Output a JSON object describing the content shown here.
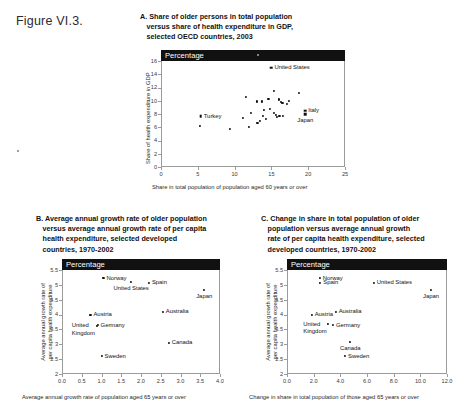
{
  "figure_label": "Figure VI.3.",
  "panels": [
    {
      "id": "A",
      "title_lines": [
        "A. Share of older persons in total population",
        "versus share of health expenditure in GDP,",
        "selected OECD countries, 2003"
      ],
      "header_label": "Percentage"
    },
    {
      "id": "B",
      "title_lines": [
        "B. Average annual growth rate of older population",
        "versus average annual growth rate of per capita",
        "health expenditure, selected developed",
        "countries, 1970-2002"
      ],
      "header_label": "Percentage"
    },
    {
      "id": "C",
      "title_lines": [
        "C. Change in share in total population of older",
        "population versus average annual growth",
        "rate of per capita health expenditure, selected",
        "developed countries, 1970-2002"
      ],
      "header_label": "Percentage"
    }
  ],
  "chart_data": [
    {
      "panel": "A",
      "type": "scatter",
      "title": "A. Share of older persons in total population versus share of health expenditure in GDP, selected OECD countries, 2003",
      "unit_banner": "Percentage",
      "xlabel": "Share in total population of population aged 60 years or over",
      "ylabel": "Share of health expenditure in GDP",
      "xlim": [
        0,
        25
      ],
      "ylim": [
        0,
        16
      ],
      "xticks": [
        0,
        5,
        10,
        15,
        20,
        25
      ],
      "yticks": [
        0,
        2,
        4,
        6,
        8,
        10,
        12,
        14,
        16
      ],
      "xtick_labels": [
        "0",
        "5",
        "10",
        "15",
        "20",
        "25"
      ],
      "ytick_labels": [
        "0",
        "2",
        "4",
        "6",
        "8",
        "10",
        "12",
        "14",
        "16"
      ],
      "grid": false,
      "legend": "none",
      "points": [
        {
          "x": 15.0,
          "y": 15.0,
          "label": "United States",
          "label_pos": "right",
          "marker": "square"
        },
        {
          "x": 5.4,
          "y": 7.7,
          "label": "Turkey",
          "label_pos": "right",
          "marker": "square"
        },
        {
          "x": 19.6,
          "y": 8.5,
          "label": "Italy",
          "label_pos": "right",
          "marker": "square"
        },
        {
          "x": 19.6,
          "y": 8.0,
          "label": "Japan",
          "label_pos": "below",
          "marker": "square"
        },
        {
          "x": 5.3,
          "y": 6.2,
          "label": "",
          "marker": "dot"
        },
        {
          "x": 9.4,
          "y": 5.7,
          "label": "",
          "marker": "dot"
        },
        {
          "x": 11.1,
          "y": 7.4,
          "label": "",
          "marker": "dot"
        },
        {
          "x": 11.6,
          "y": 10.6,
          "label": "",
          "marker": "dot"
        },
        {
          "x": 11.9,
          "y": 6.0,
          "label": "",
          "marker": "dot"
        },
        {
          "x": 12.2,
          "y": 8.2,
          "label": "",
          "marker": "dot"
        },
        {
          "x": 13.0,
          "y": 9.9,
          "label": "",
          "marker": "dot"
        },
        {
          "x": 13.1,
          "y": 6.7,
          "label": "",
          "marker": "dot"
        },
        {
          "x": 13.4,
          "y": 6.9,
          "label": "",
          "marker": "dot"
        },
        {
          "x": 13.7,
          "y": 9.9,
          "label": "",
          "marker": "dot"
        },
        {
          "x": 13.9,
          "y": 7.7,
          "label": "",
          "marker": "dot"
        },
        {
          "x": 14.0,
          "y": 8.6,
          "label": "",
          "marker": "dot"
        },
        {
          "x": 14.3,
          "y": 7.2,
          "label": "",
          "marker": "dot"
        },
        {
          "x": 14.6,
          "y": 10.3,
          "label": "",
          "marker": "dot"
        },
        {
          "x": 14.8,
          "y": 8.8,
          "label": "",
          "marker": "dot"
        },
        {
          "x": 15.3,
          "y": 11.5,
          "label": "",
          "marker": "dot"
        },
        {
          "x": 15.4,
          "y": 8.2,
          "label": "",
          "marker": "dot"
        },
        {
          "x": 15.6,
          "y": 7.8,
          "label": "",
          "marker": "dot"
        },
        {
          "x": 15.8,
          "y": 7.6,
          "label": "",
          "marker": "dot"
        },
        {
          "x": 16.0,
          "y": 10.2,
          "label": "",
          "marker": "dot"
        },
        {
          "x": 16.1,
          "y": 7.7,
          "label": "",
          "marker": "dot"
        },
        {
          "x": 16.3,
          "y": 9.8,
          "label": "",
          "marker": "dot"
        },
        {
          "x": 16.5,
          "y": 9.7,
          "label": "",
          "marker": "dot"
        },
        {
          "x": 16.6,
          "y": 7.7,
          "label": "",
          "marker": "dot"
        },
        {
          "x": 17.1,
          "y": 9.5,
          "label": "",
          "marker": "dot"
        },
        {
          "x": 17.4,
          "y": 10.0,
          "label": "",
          "marker": "dot"
        },
        {
          "x": 18.8,
          "y": 11.2,
          "label": "",
          "marker": "dot"
        }
      ]
    },
    {
      "panel": "B",
      "type": "scatter",
      "title": "B. Average annual growth rate of older population versus average annual growth rate of per capita health expenditure, selected developed countries, 1970-2002",
      "unit_banner": "Percentage",
      "xlabel": "Average annual growth rate of population aged 65 years or over",
      "ylabel": "Average annual growth rate of per capita health expenditure",
      "xlim": [
        0.0,
        4.0
      ],
      "ylim": [
        2.0,
        5.5
      ],
      "xticks": [
        0.0,
        0.5,
        1.0,
        1.5,
        2.0,
        2.5,
        3.0,
        3.5,
        4.0
      ],
      "yticks": [
        2,
        2.5,
        3,
        3.5,
        4,
        4.5,
        5,
        5.5
      ],
      "xtick_labels": [
        "0.0",
        "0.5",
        "1.0",
        "1.5",
        "2.0",
        "2.5",
        "3.0",
        "3.5",
        "4.0"
      ],
      "ytick_labels": [
        "2",
        "2.5",
        "3",
        "3.5",
        "4",
        "4.5",
        "5",
        "5.5"
      ],
      "grid": false,
      "legend": "none",
      "points": [
        {
          "x": 1.05,
          "y": 5.23,
          "label": "Norway",
          "label_pos": "right"
        },
        {
          "x": 1.75,
          "y": 5.1,
          "label": "United States",
          "label_pos": "below"
        },
        {
          "x": 2.2,
          "y": 5.07,
          "label": "Spain",
          "label_pos": "right"
        },
        {
          "x": 3.6,
          "y": 4.83,
          "label": "Japan",
          "label_pos": "below"
        },
        {
          "x": 2.55,
          "y": 4.1,
          "label": "Australia",
          "label_pos": "right"
        },
        {
          "x": 0.72,
          "y": 4.0,
          "label": "Austria",
          "label_pos": "right"
        },
        {
          "x": 0.9,
          "y": 3.65,
          "label": "Germany",
          "label_pos": "right"
        },
        {
          "x": 0.88,
          "y": 3.62,
          "label": "United Kingdom",
          "label_pos": "left"
        },
        {
          "x": 2.7,
          "y": 3.05,
          "label": "Canada",
          "label_pos": "right"
        },
        {
          "x": 1.0,
          "y": 2.6,
          "label": "Sweden",
          "label_pos": "right"
        }
      ]
    },
    {
      "panel": "C",
      "type": "scatter",
      "title": "C. Change in share in total population of older population versus average annual growth rate of per capita health expenditure, selected developed countries, 1970-2002",
      "unit_banner": "Percentage",
      "xlabel": "Change in share in total population of those aged 65 years or over",
      "ylabel": "Average annual growth rate of per capita health expenditure",
      "xlim": [
        0.0,
        12.0
      ],
      "ylim": [
        2.0,
        5.5
      ],
      "xticks": [
        0.0,
        2.0,
        4.0,
        6.0,
        8.0,
        10.0,
        12.0
      ],
      "yticks": [
        2,
        2.5,
        3,
        3.5,
        4,
        4.5,
        5,
        5.5
      ],
      "xtick_labels": [
        "0.0",
        "2.0",
        "4.0",
        "6.0",
        "8.0",
        "10.0",
        "12.0"
      ],
      "ytick_labels": [
        "2",
        "2.5",
        "3",
        "3.5",
        "4",
        "4.5",
        "5",
        "5.5"
      ],
      "grid": false,
      "legend": "none",
      "points": [
        {
          "x": 2.45,
          "y": 5.23,
          "label": "Norway",
          "label_pos": "right"
        },
        {
          "x": 2.5,
          "y": 5.07,
          "label": "Spain",
          "label_pos": "right"
        },
        {
          "x": 6.5,
          "y": 5.07,
          "label": "United States",
          "label_pos": "right"
        },
        {
          "x": 10.8,
          "y": 4.83,
          "label": "Japan",
          "label_pos": "below"
        },
        {
          "x": 3.65,
          "y": 4.1,
          "label": "Australia",
          "label_pos": "right"
        },
        {
          "x": 1.85,
          "y": 4.0,
          "label": "Austria",
          "label_pos": "right"
        },
        {
          "x": 3.45,
          "y": 3.65,
          "label": "Germany",
          "label_pos": "right"
        },
        {
          "x": 3.1,
          "y": 3.68,
          "label": "United Kingdom",
          "label_pos": "left"
        },
        {
          "x": 4.75,
          "y": 3.08,
          "label": "Canada",
          "label_pos": "below"
        },
        {
          "x": 4.35,
          "y": 2.6,
          "label": "Sweden",
          "label_pos": "right"
        }
      ]
    }
  ]
}
